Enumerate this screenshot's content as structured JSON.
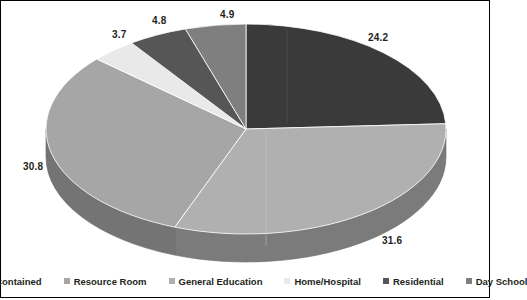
{
  "chart_data": {
    "type": "pie",
    "title": "",
    "subtitle": "",
    "xlabel": "",
    "ylabel": "",
    "three_d": true,
    "legend_position": "bottom",
    "grid": false,
    "start_angle_deg": 0,
    "direction": "clockwise",
    "categories": [
      "Self-Contained",
      "Resource Room",
      "General Education",
      "Home/Hospital",
      "Residential",
      "Day School"
    ],
    "values": [
      24.2,
      30.8,
      31.6,
      3.7,
      4.8,
      4.9
    ],
    "slice_colors": [
      "#3a3a3a",
      "#a6a6a6",
      "#b0b0b0",
      "#e9e9e9",
      "#565656",
      "#7f7f7f"
    ],
    "draw_order_clockwise": [
      {
        "label": "Self-Contained",
        "value": 24.2,
        "color": "#3a3a3a"
      },
      {
        "label": "General Education",
        "value": 31.6,
        "color": "#b0b0b0"
      },
      {
        "label": "Resource Room",
        "value": 30.8,
        "color": "#a6a6a6"
      },
      {
        "label": "Home/Hospital",
        "value": 3.7,
        "color": "#e9e9e9"
      },
      {
        "label": "Residential",
        "value": 4.8,
        "color": "#565656"
      },
      {
        "label": "Day School",
        "value": 4.9,
        "color": "#7f7f7f"
      }
    ],
    "data_labels": [
      "24.2",
      "31.6",
      "30.8",
      "3.7",
      "4.8",
      "4.9"
    ]
  },
  "labels": {
    "self_contained": "24.2",
    "general_education": "31.6",
    "resource_room": "30.8",
    "home_hospital": "3.7",
    "residential": "4.8",
    "day_school": "4.9"
  },
  "legend": {
    "items": [
      {
        "label": "Self-Contained",
        "color": "#3a3a3a"
      },
      {
        "label": "Resource Room",
        "color": "#a6a6a6"
      },
      {
        "label": "General Education",
        "color": "#b0b0b0"
      },
      {
        "label": "Home/Hospital",
        "color": "#e9e9e9"
      },
      {
        "label": "Residential",
        "color": "#565656"
      },
      {
        "label": "Day School",
        "color": "#7f7f7f"
      }
    ]
  },
  "colors": {
    "background": "#ffffff",
    "border": "#000000",
    "text": "#231f20"
  }
}
